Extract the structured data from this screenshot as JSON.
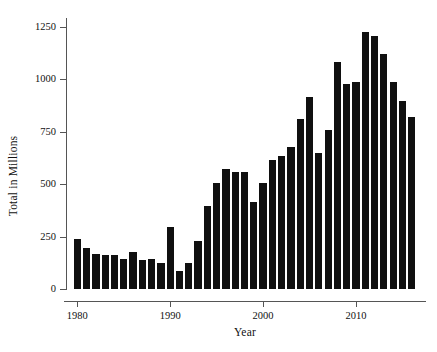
{
  "chart_data": {
    "type": "bar",
    "title": "",
    "subtitle": "",
    "xlabel": "Year",
    "ylabel": "Total in Millions",
    "xlim": [
      1979,
      2017
    ],
    "ylim": [
      0,
      1300
    ],
    "grid": false,
    "legend": null,
    "bar_color": "#101010",
    "x_ticks": [
      1980,
      1990,
      2000,
      2010
    ],
    "x_tick_labels": [
      "1980",
      "1990",
      "2000",
      "2010"
    ],
    "y_ticks": [
      0,
      250,
      500,
      750,
      1000,
      1250
    ],
    "y_tick_labels": [
      "0",
      "250",
      "500",
      "750",
      "1000",
      "1250"
    ],
    "categories": [
      1980,
      1981,
      1982,
      1983,
      1984,
      1985,
      1986,
      1987,
      1988,
      1989,
      1990,
      1991,
      1992,
      1993,
      1994,
      1995,
      1996,
      1997,
      1998,
      1999,
      2000,
      2001,
      2002,
      2003,
      2004,
      2005,
      2006,
      2007,
      2008,
      2009,
      2010,
      2011,
      2012,
      2013,
      2014,
      2015,
      2016
    ],
    "values": [
      237,
      194,
      166,
      164,
      160,
      143,
      177,
      137,
      144,
      126,
      296,
      86,
      124,
      228,
      393,
      503,
      573,
      557,
      556,
      415,
      503,
      613,
      635,
      677,
      810,
      915,
      647,
      755,
      1080,
      975,
      985,
      1222,
      1205,
      1118,
      985,
      897,
      818
    ]
  },
  "axis": {
    "y_title": "Total in Millions",
    "x_title": "Year"
  }
}
